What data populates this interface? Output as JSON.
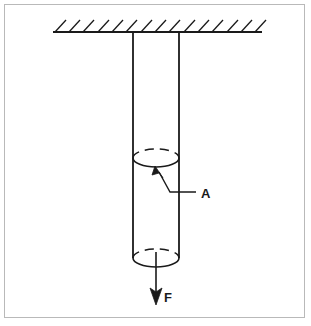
{
  "figure": {
    "title": "Hanging cylindrical rod under axial tensile force",
    "canvas": {
      "width": 311,
      "height": 326,
      "background": "#ffffff"
    },
    "border": {
      "color": "#b9b9b9",
      "width": 1
    },
    "stroke_color": "#1a1a1a",
    "labels": {
      "cross_section_area": "A",
      "force": "F"
    },
    "support": {
      "name": "ceiling-support",
      "line": {
        "x1": 53,
        "y1": 32,
        "x2": 262,
        "y2": 32
      },
      "hatch_count": 15,
      "hatch_dx": 11,
      "hatch_dy": 12,
      "hatch_spacing": 14.4
    },
    "rod": {
      "left_x": 133,
      "right_x": 179,
      "top_y": 32,
      "bottom_y": 258,
      "ellipse_ry": 9
    },
    "section_ellipse": {
      "cx": 156,
      "cy": 158,
      "rx": 23,
      "ry": 9
    },
    "bottom_ellipse": {
      "cx": 156,
      "cy": 258,
      "rx": 23,
      "ry": 9
    },
    "leader": {
      "name": "leader-line-A",
      "arrow_tip": {
        "x": 155,
        "y": 168
      },
      "bend": {
        "x": 170,
        "y": 192
      },
      "end": {
        "x": 196,
        "y": 192
      },
      "label_pos": {
        "x": 201,
        "y": 198
      }
    },
    "force_arrow": {
      "name": "force-arrow-F",
      "x": 156,
      "y1": 258,
      "y2": 302,
      "label_pos": {
        "x": 163,
        "y": 302
      }
    }
  }
}
